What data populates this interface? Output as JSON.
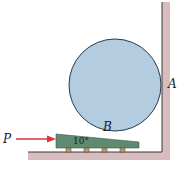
{
  "diagram": {
    "labels": {
      "force": "P",
      "contact_wall": "A",
      "contact_wedge": "B",
      "wedge_angle": "10°"
    },
    "colors": {
      "cylinder_fill": "#b3cce0",
      "cylinder_stroke": "#2a3a4a",
      "wedge_fill": "#5f8a72",
      "wall_shadow": "#c9a9ac",
      "force_arrow": "#e0323a",
      "roller": "#b89a6a"
    },
    "rollers_count": 4
  }
}
